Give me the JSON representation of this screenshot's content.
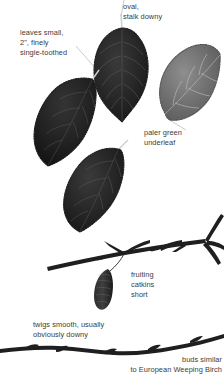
{
  "plate": {
    "subject": "birch identification plate",
    "background_color": "#ffffff",
    "text_color": "#3b3b3b",
    "leader_line_color": "#b9b9b9",
    "ink_dark": "#242424",
    "ink_mid": "#6f6f6f"
  },
  "labels": {
    "oval_stalk": "oval,\nstalk downy",
    "leaves_small": "leaves small,\n2\", finely\nsingle-toothed",
    "paler_green": "paler green\nunderleaf",
    "fruiting_catkins": "fruiting\ncatkins\nshort",
    "twigs_smooth": "twigs smooth, usually\nobviously downy",
    "buds_similar": "buds similar\nto European Weeping Birch"
  },
  "specimens": {
    "leaf_top_center": "dark birch leaf, upper surface, stalk pointing up",
    "leaf_left": "dark birch leaf, upper surface, stalk pointing up-right",
    "leaf_center_lower": "dark birch leaf, upper surface, stalk pointing up-right",
    "leaf_right": "paler birch leaf showing downy underside, stalk pointing down-left",
    "fruiting_branch": "branch with side twigs and a hanging fruiting catkin",
    "catkin": "short cylindrical fruiting catkin",
    "lower_twig": "slender twig with buds"
  }
}
